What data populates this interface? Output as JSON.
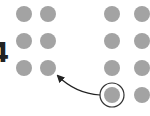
{
  "diagram": {
    "label_number": "4",
    "colors": {
      "dot": "#a3a3a3",
      "ring": "#333333",
      "arrow": "#222222",
      "text": "#222222",
      "background": "#ffffff"
    },
    "left_grid": {
      "columns": 2,
      "rows": 3,
      "dots": [
        {
          "cx": 24,
          "cy": 14
        },
        {
          "cx": 48,
          "cy": 14
        },
        {
          "cx": 24,
          "cy": 41
        },
        {
          "cx": 48,
          "cy": 41
        },
        {
          "cx": 24,
          "cy": 68
        },
        {
          "cx": 48,
          "cy": 68
        }
      ]
    },
    "right_grid": {
      "columns": 2,
      "rows": 4,
      "dots": [
        {
          "cx": 112,
          "cy": 14
        },
        {
          "cx": 142,
          "cy": 14
        },
        {
          "cx": 112,
          "cy": 41
        },
        {
          "cx": 142,
          "cy": 41
        },
        {
          "cx": 112,
          "cy": 68
        },
        {
          "cx": 142,
          "cy": 68
        },
        {
          "cx": 112,
          "cy": 95
        },
        {
          "cx": 142,
          "cy": 95
        }
      ],
      "highlighted_dot_index": 6
    },
    "dot_radius": 8,
    "ring_radius": 12,
    "arrow": {
      "from": "highlighted dot in right grid",
      "to": "left grid bottom-right dot"
    }
  }
}
